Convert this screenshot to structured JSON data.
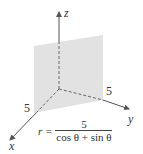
{
  "figure": {
    "type": "3d-coordinate-plot",
    "axes": {
      "x": {
        "label": "x",
        "tick_label": "5"
      },
      "y": {
        "label": "y",
        "tick_label": "5"
      },
      "z": {
        "label": "z"
      }
    },
    "surface": {
      "description": "vertical plane x + y = 5",
      "fill_color": "#e2e2e2"
    },
    "axis_color": "#555555",
    "equation": {
      "lhs": "r =",
      "numerator": "5",
      "denominator": "cos θ + sin θ"
    }
  }
}
